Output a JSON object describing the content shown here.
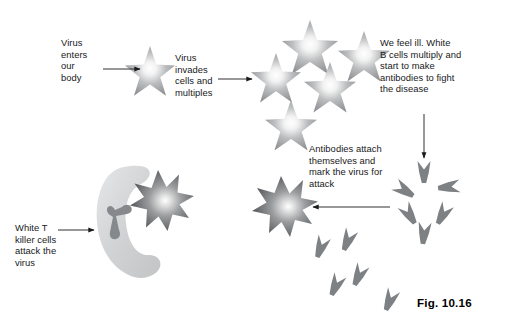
{
  "figure": {
    "caption": "Fig. 10.16",
    "background_color": "#ffffff",
    "text_color": "#17191b"
  },
  "labels": {
    "virus_enters": "Virus\nenters\nour\nbody",
    "virus_invades": "Virus\ninvades\ncells and\nmultiples",
    "we_feel_ill": "We feel ill. White\nB cells multiply and\nstart to make\nantibodies to fight\nthe disease",
    "antibodies_attach": "Antibodies attach\nthemselves and\nmark the virus for\nattack",
    "white_t_killer": "White T\nkiller cells\nattack the\nvirus"
  },
  "colors": {
    "virus_edge": "#8e9093",
    "virus_core": "#ffffff",
    "virus_dark_edge": "#5f6265",
    "antibody": "#7e8184",
    "tcell_body": "#d7d8d9",
    "tcell_receptor": "#86898c",
    "arrow": "#1a1a1a"
  },
  "diagram": {
    "type": "immune-response-flow",
    "stages": [
      {
        "name": "virus-entry",
        "label_key": "virus_enters",
        "shape": "six-point-star",
        "count": 1
      },
      {
        "name": "virus-multiplication",
        "label_key": "virus_invades",
        "shape": "six-point-star",
        "count": 5
      },
      {
        "name": "b-cell-antibody-production",
        "label_key": "we_feel_ill",
        "shape": "antibody-y-cluster",
        "count": 6
      },
      {
        "name": "antibody-marking",
        "label_key": "antibodies_attach",
        "shape": "marked-virus",
        "count": 1
      },
      {
        "name": "t-cell-attack",
        "label_key": "white_t_killer",
        "shape": "t-killer-cell",
        "count": 1
      }
    ],
    "arrows": [
      {
        "name": "arrow-entry-to-virus",
        "direction": "right"
      },
      {
        "name": "arrow-virus-to-cluster",
        "direction": "right"
      },
      {
        "name": "arrow-cluster-to-antibodies",
        "direction": "down"
      },
      {
        "name": "arrow-antibodies-to-marked-virus",
        "direction": "left"
      },
      {
        "name": "arrow-label-to-tcell",
        "direction": "right"
      }
    ]
  }
}
